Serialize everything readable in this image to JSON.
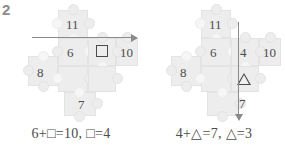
{
  "exercise": {
    "number": "2"
  },
  "colors": {
    "background": "#ffffff",
    "puzzle_piece": "#ededed",
    "puzzle_edge": "#e3e3e3",
    "text": "#4c4c4c",
    "arrow": "#8a8a8a",
    "exercise_number": "#8d8d8d"
  },
  "panels": [
    {
      "id": "left",
      "arrow": {
        "direction": "right",
        "orientation": "horizontal"
      },
      "puzzle_numbers": {
        "top": "11",
        "middle_left": "6",
        "middle_center": "",
        "middle_right": "10",
        "left": "8",
        "bottom": "7"
      },
      "unknown_glyph": "square",
      "equation": "6+□=10,  □=4",
      "equation_parts": {
        "addend1": "6",
        "unknown": "□",
        "sum": "10",
        "answer": "4"
      }
    },
    {
      "id": "right",
      "arrow": {
        "direction": "down",
        "orientation": "vertical"
      },
      "puzzle_numbers": {
        "top": "11",
        "middle_left": "6",
        "middle_center": "4",
        "middle_right": "10",
        "left": "8",
        "bottom": "7"
      },
      "unknown_glyph": "triangle",
      "equation": "4+△=7,  △=3",
      "equation_parts": {
        "addend1": "4",
        "unknown": "△",
        "sum": "7",
        "answer": "3"
      }
    }
  ]
}
